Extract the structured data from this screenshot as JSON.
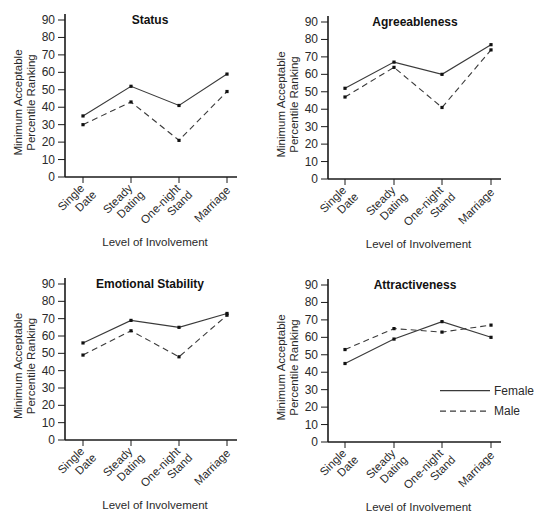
{
  "chart_data": [
    {
      "type": "line",
      "title": "Status",
      "categories": [
        "Single Date",
        "Steady Dating",
        "One-night Stand",
        "Marriage"
      ],
      "category_lines": [
        [
          "Single",
          "Date"
        ],
        [
          "Steady",
          "Dating"
        ],
        [
          "One-night",
          "Stand"
        ],
        [
          "Marriage"
        ]
      ],
      "series": [
        {
          "name": "Female",
          "style": "solid",
          "values": [
            35,
            52,
            41,
            59
          ]
        },
        {
          "name": "Male",
          "style": "dashed",
          "values": [
            30,
            43,
            21,
            49
          ]
        }
      ],
      "xlabel": "Level of Involvement",
      "ylabel": [
        "Minimum Acceptable",
        "Percentile Ranking"
      ],
      "ylim": [
        0,
        90
      ],
      "yticks": [
        0,
        10,
        20,
        30,
        40,
        50,
        60,
        70,
        80,
        90
      ],
      "grid": false,
      "legend": false
    },
    {
      "type": "line",
      "title": "Agreeableness",
      "categories": [
        "Single Date",
        "Steady Dating",
        "One-night Stand",
        "Marriage"
      ],
      "category_lines": [
        [
          "Single",
          "Date"
        ],
        [
          "Steady",
          "Dating"
        ],
        [
          "One-night",
          "Stand"
        ],
        [
          "Marriage"
        ]
      ],
      "series": [
        {
          "name": "Female",
          "style": "solid",
          "values": [
            52,
            67,
            60,
            77
          ]
        },
        {
          "name": "Male",
          "style": "dashed",
          "values": [
            47,
            64,
            41,
            74
          ]
        }
      ],
      "xlabel": "Level of Involvement",
      "ylabel": [
        "Minimum Acceptable",
        "Percentile Ranking"
      ],
      "ylim": [
        0,
        90
      ],
      "yticks": [
        0,
        10,
        20,
        30,
        40,
        50,
        60,
        70,
        80,
        90
      ],
      "grid": false,
      "legend": false
    },
    {
      "type": "line",
      "title": "Emotional Stability",
      "categories": [
        "Single Date",
        "Steady Dating",
        "One-night Stand",
        "Marriage"
      ],
      "category_lines": [
        [
          "Single",
          "Date"
        ],
        [
          "Steady",
          "Dating"
        ],
        [
          "One-night",
          "Stand"
        ],
        [
          "Marriage"
        ]
      ],
      "series": [
        {
          "name": "Female",
          "style": "solid",
          "values": [
            56,
            69,
            65,
            73
          ]
        },
        {
          "name": "Male",
          "style": "dashed",
          "values": [
            49,
            63,
            48,
            72
          ]
        }
      ],
      "xlabel": "Level of Involvement",
      "ylabel": [
        "Minimum Acceptable",
        "Percentile Ranking"
      ],
      "ylim": [
        0,
        90
      ],
      "yticks": [
        0,
        10,
        20,
        30,
        40,
        50,
        60,
        70,
        80,
        90
      ],
      "grid": false,
      "legend": false
    },
    {
      "type": "line",
      "title": "Attractiveness",
      "categories": [
        "Single Date",
        "Steady Dating",
        "One-night Stand",
        "Marriage"
      ],
      "category_lines": [
        [
          "Single",
          "Date"
        ],
        [
          "Steady",
          "Dating"
        ],
        [
          "One-night",
          "Stand"
        ],
        [
          "Marriage"
        ]
      ],
      "series": [
        {
          "name": "Female",
          "style": "solid",
          "values": [
            45,
            59,
            69,
            60
          ]
        },
        {
          "name": "Male",
          "style": "dashed",
          "values": [
            53,
            65,
            63,
            67
          ]
        }
      ],
      "xlabel": "Level of Involvement",
      "ylabel": [
        "Minimum Acceptable",
        "Percentile Ranking"
      ],
      "ylim": [
        0,
        90
      ],
      "yticks": [
        0,
        10,
        20,
        30,
        40,
        50,
        60,
        70,
        80,
        90
      ],
      "grid": false,
      "legend": true,
      "legend_entries": [
        {
          "label": "Female",
          "style": "solid"
        },
        {
          "label": "Male",
          "style": "dashed"
        }
      ],
      "legend_position": "lower right"
    }
  ],
  "colors": {
    "line": "#3a3a3a",
    "axis": "#1a1a1a",
    "text": "#2a2a2a"
  }
}
